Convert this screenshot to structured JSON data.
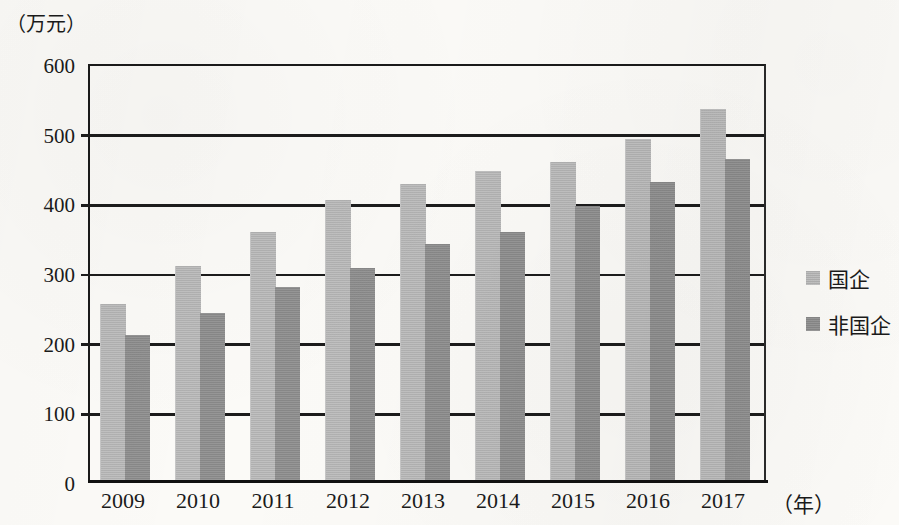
{
  "chart_data": {
    "type": "bar",
    "title": "",
    "subtitle": "",
    "xlabel": "（年）",
    "ylabel": "（万元）",
    "categories": [
      "2009",
      "2010",
      "2011",
      "2012",
      "2013",
      "2014",
      "2015",
      "2016",
      "2017"
    ],
    "series": [
      {
        "name": "国企",
        "color": "#b9b9b9",
        "values": [
          255,
          310,
          359,
          405,
          428,
          446,
          459,
          492,
          535
        ]
      },
      {
        "name": "非国企",
        "color": "#8e8e8e",
        "values": [
          211,
          242,
          280,
          307,
          341,
          359,
          396,
          430,
          463
        ]
      }
    ],
    "ylim": [
      0,
      600
    ],
    "ytick_values": [
      0,
      100,
      200,
      300,
      400,
      500,
      600
    ],
    "ytick_labels": [
      "0",
      "100",
      "200",
      "300",
      "400",
      "500",
      "600"
    ],
    "grid": true,
    "legend_position": "right"
  },
  "legend": {
    "items": [
      {
        "label": "国企"
      },
      {
        "label": "非国企"
      }
    ]
  }
}
